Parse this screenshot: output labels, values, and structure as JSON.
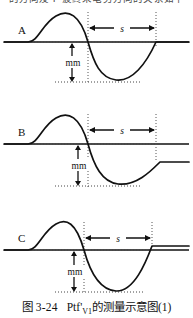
{
  "header": {
    "clipped_text": "的方向及 P 波终末电势方向的关系如下"
  },
  "figure": {
    "caption_number": "图 3-24",
    "caption_symbol": "Ptf",
    "caption_symbol_prime": "'",
    "caption_subscript": "V1",
    "caption_text": "的测量示意图(1)",
    "panels": [
      {
        "id": "A",
        "label": "A",
        "depth_label": "mm",
        "duration_label": "s",
        "depth_mm": 1.0,
        "duration_s": 0.04
      },
      {
        "id": "B",
        "label": "B",
        "depth_label": "mm",
        "duration_label": "s",
        "depth_mm": 1.0,
        "duration_s": 0.04
      },
      {
        "id": "C",
        "label": "C",
        "depth_label": "mm",
        "duration_label": "s",
        "depth_mm": 1.0,
        "duration_s": 0.04
      }
    ]
  },
  "style": {
    "ink": "#111111",
    "baseline": "#111111",
    "guide": "#555555",
    "background": "#ffffff"
  }
}
